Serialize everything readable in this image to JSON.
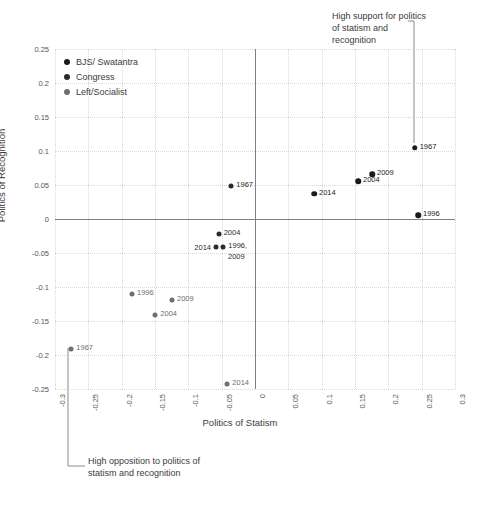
{
  "chart_data": {
    "type": "scatter",
    "title": "",
    "xlabel": "Politics of Statism",
    "ylabel": "Politics of Recognition",
    "xlim": [
      -0.3,
      0.3
    ],
    "ylim": [
      -0.25,
      0.25
    ],
    "xticks": [
      "-0.3",
      "-0.25",
      "-0.2",
      "-0.15",
      "-0.1",
      "-0.05",
      "0",
      "0.05",
      "0.1",
      "0.15",
      "0.2",
      "0.25",
      "0.3"
    ],
    "xtick_values": [
      -0.3,
      -0.25,
      -0.2,
      -0.15,
      -0.1,
      -0.05,
      0,
      0.05,
      0.1,
      0.15,
      0.2,
      0.25,
      0.3
    ],
    "yticks": [
      "0.25",
      "0.2",
      "0.15",
      "0.1",
      "0.05",
      "0",
      "-0.05",
      "-0.1",
      "-0.15",
      "-0.2",
      "-0.25"
    ],
    "ytick_values": [
      0.25,
      0.2,
      0.15,
      0.1,
      0.05,
      0,
      -0.05,
      -0.1,
      -0.15,
      -0.2,
      -0.25
    ],
    "grid": true,
    "legend_position": "top-left",
    "series": [
      {
        "name": "BJS/ Swatantra",
        "color": "#1a1a1a",
        "marker_size": 5.5,
        "points": [
          {
            "label": "1967",
            "x": 0.2395,
            "y": 0.1045,
            "label_side": "right"
          },
          {
            "label": "2009",
            "x": 0.1755,
            "y": 0.0655,
            "label_side": "right"
          },
          {
            "label": "2004",
            "x": 0.1545,
            "y": 0.0555,
            "label_side": "right"
          },
          {
            "label": "2014",
            "x": 0.0885,
            "y": 0.0375,
            "label_side": "right"
          },
          {
            "label": "1996",
            "x": 0.2445,
            "y": 0.0055,
            "label_side": "right"
          }
        ]
      },
      {
        "name": "Congress",
        "color": "#2b2b2b",
        "marker_size": 5,
        "points": [
          {
            "label": "1967",
            "x": -0.0355,
            "y": 0.0485,
            "label_side": "right"
          },
          {
            "label": "2004",
            "x": -0.0545,
            "y": -0.0225,
            "label_side": "right"
          },
          {
            "label": "2014",
            "x": -0.0585,
            "y": -0.0415,
            "label_side": "left"
          },
          {
            "label": "1996,",
            "x": -0.0475,
            "y": -0.0415,
            "label_side": "right"
          },
          {
            "label": "2009",
            "x": -0.0475,
            "y": -0.0415,
            "label_side": "below"
          }
        ]
      },
      {
        "name": "Left/Socialist",
        "color": "#6e6e6e",
        "marker_size": 5,
        "points": [
          {
            "label": "1996",
            "x": -0.1845,
            "y": -0.1105,
            "label_side": "right"
          },
          {
            "label": "2009",
            "x": -0.1245,
            "y": -0.1195,
            "label_side": "right"
          },
          {
            "label": "2004",
            "x": -0.1495,
            "y": -0.1405,
            "label_side": "right"
          },
          {
            "label": "1967",
            "x": -0.2755,
            "y": -0.1915,
            "label_side": "right"
          },
          {
            "label": "2014",
            "x": -0.0415,
            "y": -0.2425,
            "label_side": "right"
          }
        ]
      }
    ],
    "annotations": [
      {
        "id": "high-support",
        "text": "High support for politics of statism and recognition",
        "target_point": {
          "series": "BJS/ Swatantra",
          "label": "1967"
        }
      },
      {
        "id": "high-opposition",
        "text": "High opposition to politics of statism and recognition",
        "target_point": {
          "series": "Left/Socialist",
          "label": "1967"
        }
      }
    ]
  },
  "legend": {
    "items": [
      {
        "label": "BJS/ Swatantra",
        "color": "#1a1a1a"
      },
      {
        "label": "Congress",
        "color": "#2b2b2b"
      },
      {
        "label": "Left/Socialist",
        "color": "#6e6e6e"
      }
    ]
  },
  "annotations": {
    "top": "High support for politics of statism and recognition",
    "bottom": "High opposition to politics of statism and recognition"
  },
  "axes": {
    "x_title": "Politics of Statism",
    "y_title": "Politics of Recognition"
  }
}
